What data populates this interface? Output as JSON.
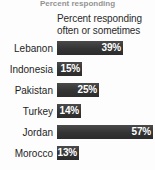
{
  "cropped_title": "Percent responding",
  "header": {
    "line1": "Percent responding",
    "line2": "often or sometimes"
  },
  "colors": {
    "bar": "#343434",
    "bar_label": "#ffffff",
    "category_label": "#1e1e1e",
    "background": "#fdfdfd"
  },
  "chart_data": {
    "type": "bar",
    "title": "Percent responding often or sometimes",
    "xlabel": "",
    "ylabel": "",
    "xlim": [
      0,
      60
    ],
    "grid": false,
    "legend": false,
    "orientation": "horizontal",
    "value_suffix": "%",
    "categories": [
      "Lebanon",
      "Indonesia",
      "Pakistan",
      "Turkey",
      "Jordan",
      "Morocco"
    ],
    "values": [
      39,
      15,
      25,
      14,
      57,
      13
    ],
    "labels": [
      "39%",
      "15%",
      "25%",
      "14%",
      "57%",
      "13%"
    ],
    "rows": [
      {
        "category": "Lebanon",
        "value": 39,
        "label": "39%"
      },
      {
        "category": "Indonesia",
        "value": 15,
        "label": "15%"
      },
      {
        "category": "Pakistan",
        "value": 25,
        "label": "25%"
      },
      {
        "category": "Turkey",
        "value": 14,
        "label": "14%"
      },
      {
        "category": "Jordan",
        "value": 57,
        "label": "57%"
      },
      {
        "category": "Morocco",
        "value": 13,
        "label": "13%"
      }
    ]
  }
}
